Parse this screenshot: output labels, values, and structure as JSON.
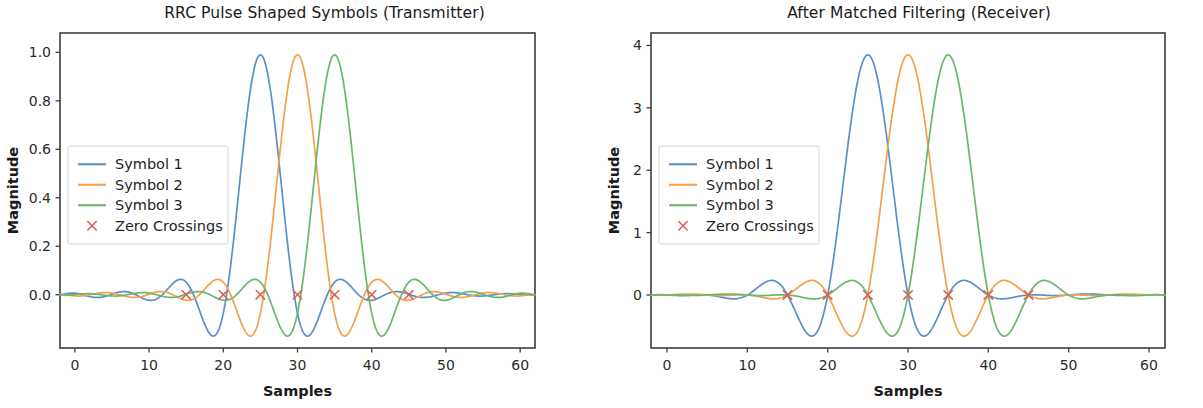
{
  "figure": {
    "width": 1203,
    "height": 408,
    "background": "#ffffff"
  },
  "colors": {
    "symbol1": "#5b8fc9",
    "symbol2": "#f5a04a",
    "symbol3": "#6bb76b",
    "zero_crossing": "#e06052",
    "axis": "#3c3c3c",
    "text": "#1a1a1a",
    "legend_border": "#d4d4d4"
  },
  "chart_data": [
    {
      "type": "line",
      "panel": "left",
      "title": "RRC Pulse Shaped Symbols (Transmitter)",
      "xlabel": "Samples",
      "ylabel": "Magnitude",
      "xlim": [
        -2,
        62
      ],
      "ylim": [
        -0.22,
        1.08
      ],
      "xticks": [
        0,
        10,
        20,
        30,
        40,
        50,
        60
      ],
      "xticklabels": [
        "0",
        "10",
        "20",
        "30",
        "40",
        "50",
        "60"
      ],
      "yticks": [
        0.0,
        0.2,
        0.4,
        0.6,
        0.8,
        1.0
      ],
      "yticklabels": [
        "0.0",
        "0.2",
        "0.4",
        "0.6",
        "0.8",
        "1.0"
      ],
      "grid": false,
      "legend_position": "center left",
      "pulse_model": {
        "kind": "root-raised-cosine",
        "rolloff": 0.35,
        "samples_per_symbol": 5,
        "peak_amplitude": 0.99
      },
      "series": [
        {
          "name": "Symbol 1",
          "color": "#5b8fc9",
          "center": 25,
          "peak": 0.99
        },
        {
          "name": "Symbol 2",
          "color": "#f5a04a",
          "center": 30,
          "peak": 0.99
        },
        {
          "name": "Symbol 3",
          "color": "#6bb76b",
          "center": 35,
          "peak": 0.99
        }
      ],
      "zero_crossings": {
        "name": "Zero Crossings",
        "color": "#e06052",
        "marker": "x",
        "x": [
          15,
          20,
          25,
          30,
          35,
          40,
          45
        ],
        "y": [
          0,
          0,
          0,
          0,
          0,
          0,
          0
        ]
      },
      "annotations": {
        "min_undershoot": -0.14,
        "sidelobe_peak": 0.04
      }
    },
    {
      "type": "line",
      "panel": "right",
      "title": "After Matched Filtering (Receiver)",
      "xlabel": "Samples",
      "ylabel": "Magnitude",
      "xlim": [
        -2,
        62
      ],
      "ylim": [
        -0.85,
        4.2
      ],
      "xticks": [
        0,
        10,
        20,
        30,
        40,
        50,
        60
      ],
      "xticklabels": [
        "0",
        "10",
        "20",
        "30",
        "40",
        "50",
        "60"
      ],
      "yticks": [
        0,
        1,
        2,
        3,
        4
      ],
      "yticklabels": [
        "0",
        "1",
        "2",
        "3",
        "4"
      ],
      "grid": false,
      "legend_position": "center left",
      "pulse_model": {
        "kind": "raised-cosine",
        "rolloff": 0.35,
        "samples_per_symbol": 5,
        "peak_amplitude": 3.85
      },
      "series": [
        {
          "name": "Symbol 1",
          "color": "#5b8fc9",
          "center": 25,
          "peak": 3.85
        },
        {
          "name": "Symbol 2",
          "color": "#f5a04a",
          "center": 30,
          "peak": 3.85
        },
        {
          "name": "Symbol 3",
          "color": "#6bb76b",
          "center": 35,
          "peak": 3.85
        }
      ],
      "zero_crossings": {
        "name": "Zero Crossings",
        "color": "#e06052",
        "marker": "x",
        "x": [
          15,
          20,
          25,
          30,
          35,
          40,
          45
        ],
        "y": [
          0,
          0,
          0,
          0,
          0,
          0,
          0
        ]
      },
      "annotations": {
        "min_undershoot": -0.55,
        "sidelobe_peak": 0.1
      }
    }
  ],
  "legend": {
    "entries": [
      {
        "label": "Symbol 1",
        "type": "line",
        "color": "#5b8fc9"
      },
      {
        "label": "Symbol 2",
        "type": "line",
        "color": "#f5a04a"
      },
      {
        "label": "Symbol 3",
        "type": "line",
        "color": "#6bb76b"
      },
      {
        "label": "Zero Crossings",
        "type": "marker",
        "color": "#e06052"
      }
    ]
  }
}
